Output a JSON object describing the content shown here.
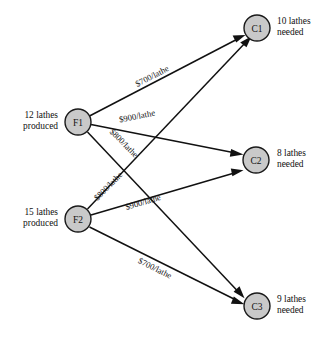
{
  "diagram": {
    "type": "transportation-network",
    "title": "",
    "node_fill_color": "#c9c9c9",
    "node_stroke_color": "#1a1a1a",
    "edge_color": "#111111",
    "background_color": "#ffffff",
    "supply_nodes": [
      {
        "id": "F1",
        "label": "F1",
        "cx": 78,
        "cy": 122,
        "r": 13,
        "annotation_line1": "12 lathes",
        "annotation_line2": "produced",
        "amount": 12,
        "units": "lathes"
      },
      {
        "id": "F2",
        "label": "F2",
        "cx": 78,
        "cy": 219,
        "r": 13,
        "annotation_line1": "15 lathes",
        "annotation_line2": "produced",
        "amount": 15,
        "units": "lathes"
      }
    ],
    "demand_nodes": [
      {
        "id": "C1",
        "label": "C1",
        "cx": 257,
        "cy": 28,
        "r": 13,
        "annotation_line1": "10 lathes",
        "annotation_line2": "needed",
        "amount": 10,
        "units": "lathes"
      },
      {
        "id": "C2",
        "label": "C2",
        "cx": 256,
        "cy": 160,
        "r": 13,
        "annotation_line1": "8 lathes",
        "annotation_line2": "needed",
        "amount": 8,
        "units": "lathes"
      },
      {
        "id": "C3",
        "label": "C3",
        "cx": 257,
        "cy": 306,
        "r": 13,
        "annotation_line1": "9 lathes",
        "annotation_line2": "needed",
        "amount": 9,
        "units": "lathes"
      }
    ],
    "edges": [
      {
        "from": "F1",
        "to": "C1",
        "label": "$700/lathe",
        "cost": 700,
        "label_x": 152,
        "label_y": 76,
        "label_rotate": -27.5
      },
      {
        "from": "F1",
        "to": "C2",
        "label": "$900/lathe",
        "cost": 900,
        "label_x": 137,
        "label_y": 116,
        "label_rotate": -11.5
      },
      {
        "from": "F1",
        "to": "C3",
        "label": "$800/lathe",
        "cost": 800,
        "label_x": 124,
        "label_y": 143,
        "label_rotate": 45.5
      },
      {
        "from": "F2",
        "to": "C1",
        "label": "$800/lathe",
        "cost": 800,
        "label_x": 108,
        "label_y": 186,
        "label_rotate": -45.5
      },
      {
        "from": "F2",
        "to": "C2",
        "label": "$900/lathe",
        "cost": 900,
        "label_x": 143,
        "label_y": 202,
        "label_rotate": -16.5
      },
      {
        "from": "F2",
        "to": "C3",
        "label": "$700/lathe",
        "cost": 700,
        "label_x": 155,
        "label_y": 268,
        "label_rotate": 26.5
      }
    ]
  },
  "annotations": {
    "f1_left": {
      "line1": "12 lathes",
      "line2": "produced"
    },
    "f2_left": {
      "line1": "15 lathes",
      "line2": "produced"
    },
    "c1_right": {
      "line1": "10 lathes",
      "line2": "needed"
    },
    "c2_right": {
      "line1": "8 lathes",
      "line2": "needed"
    },
    "c3_right": {
      "line1": "9 lathes",
      "line2": "needed"
    }
  },
  "node_labels": {
    "f1": "F1",
    "f2": "F2",
    "c1": "C1",
    "c2": "C2",
    "c3": "C3"
  },
  "edge_labels": {
    "f1_c1": "$700/lathe",
    "f1_c2": "$900/lathe",
    "f1_c3": "$800/lathe",
    "f2_c1": "$800/lathe",
    "f2_c2": "$900/lathe",
    "f2_c3": "$700/lathe"
  }
}
